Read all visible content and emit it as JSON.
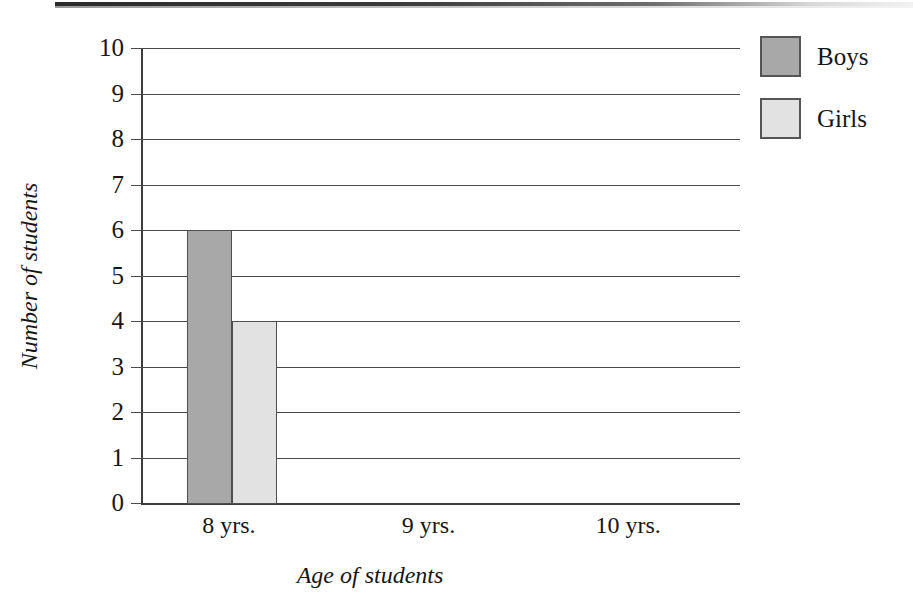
{
  "chart_data": {
    "type": "bar",
    "title": "",
    "xlabel": "Age of students",
    "ylabel": "Number of students",
    "categories": [
      "8 yrs.",
      "9 yrs.",
      "10 yrs."
    ],
    "series": [
      {
        "name": "Boys",
        "values": [
          6,
          0,
          0
        ],
        "color": "#a8a8a8"
      },
      {
        "name": "Girls",
        "values": [
          4,
          0,
          0
        ],
        "color": "#e2e2e2"
      }
    ],
    "ylim": [
      0,
      10
    ],
    "ytick_labels": [
      "0",
      "1",
      "2",
      "3",
      "4",
      "5",
      "6",
      "7",
      "8",
      "9",
      "10"
    ],
    "ytick_values": [
      0,
      1,
      2,
      3,
      4,
      5,
      6,
      7,
      8,
      9,
      10
    ],
    "grid": true,
    "legend_position": "right-top",
    "bar_outline_color": "#4f4f4f",
    "axis_color": "#3c3c3c",
    "gridline_color": "#4a4a4a",
    "background": "#ffffff"
  },
  "legend": {
    "items": [
      {
        "label": "Boys",
        "color": "#a8a8a8"
      },
      {
        "label": "Girls",
        "color": "#e2e2e2"
      }
    ]
  }
}
